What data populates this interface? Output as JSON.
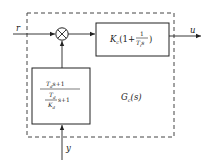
{
  "diagram": {
    "type": "control-block-diagram",
    "input_signal": "r",
    "output_signal": "u",
    "feedback_signal": "y",
    "controller_label": {
      "main": "G",
      "sub": "c",
      "arg": "(s)"
    },
    "pi_block": {
      "gain": "K",
      "gain_sub": "c",
      "open": "(1+",
      "frac_num": "1",
      "frac_den_T": "T",
      "frac_den_sub": "i",
      "frac_den_s": "s",
      "close": ")"
    },
    "filter_block": {
      "num_T": "T",
      "num_sub": "d",
      "num_rest": "s+1",
      "den_frac_num_T": "T",
      "den_frac_num_sub": "d",
      "den_frac_den_K": "K",
      "den_frac_den_sub": "d",
      "den_rest": "s+1"
    },
    "summing_junction": "multiply-cross"
  }
}
